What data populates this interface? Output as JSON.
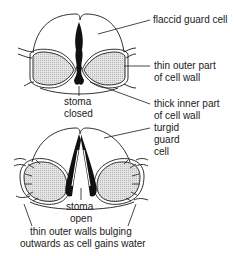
{
  "diagram": {
    "top": {
      "labels": {
        "flaccid": "flaccid guard cell",
        "thin_outer_1": "thin outer part",
        "thin_outer_2": "of cell wall",
        "thick_inner_1": "thick inner part",
        "thick_inner_2": "of cell wall",
        "stoma_1": "stoma",
        "stoma_2": "closed"
      }
    },
    "bottom": {
      "labels": {
        "turgid_1": "turgid",
        "turgid_2": "guard",
        "turgid_3": "cell",
        "stoma_1": "stoma",
        "stoma_2": "open",
        "caption_1": "thin outer walls bulging",
        "caption_2": "outwards as cell gains water"
      }
    },
    "colors": {
      "line": "#1a1a1a",
      "fill": "#d9d9d9",
      "background": "#ffffff"
    }
  }
}
